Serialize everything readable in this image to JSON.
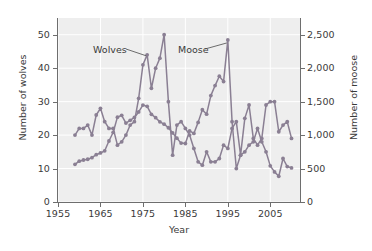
{
  "chart_data": {
    "type": "line",
    "title": "",
    "xlabel": "Year",
    "ylabel": "Number of wolves",
    "ylabel_right": "Number of moose",
    "xlim": [
      1955,
      2012
    ],
    "ylim": [
      0,
      55
    ],
    "ylim_right": [
      0,
      2750
    ],
    "grid": true,
    "legend_position": "inline-annotations",
    "xticks": [
      "1955",
      "1965",
      "1975",
      "1985",
      "1995",
      "2005"
    ],
    "xtick_values": [
      1955,
      1965,
      1975,
      1985,
      1995,
      2005
    ],
    "yticks_left": [
      "0",
      "10",
      "20",
      "30",
      "40",
      "50"
    ],
    "ytick_values_left": [
      0,
      10,
      20,
      30,
      40,
      50
    ],
    "yticks_right": [
      "0",
      "500",
      "1,000",
      "1,500",
      "2,000",
      "2,500"
    ],
    "ytick_values_right": [
      0,
      500,
      1000,
      1500,
      2000,
      2500
    ],
    "line_color": "#8a7f93",
    "marker_color": "#8a7f93",
    "plot_background": "#eeeeee",
    "annotations": [
      {
        "text": "Wolves",
        "points_to_series": "Wolves"
      },
      {
        "text": "Moose",
        "points_to_series": "Moose"
      }
    ],
    "series": [
      {
        "name": "Wolves",
        "axis": "left",
        "x": [
          1959,
          1960,
          1961,
          1962,
          1963,
          1964,
          1965,
          1966,
          1967,
          1968,
          1969,
          1970,
          1971,
          1972,
          1973,
          1974,
          1975,
          1976,
          1977,
          1978,
          1979,
          1980,
          1981,
          1982,
          1983,
          1984,
          1985,
          1986,
          1987,
          1988,
          1989,
          1990,
          1991,
          1992,
          1993,
          1994,
          1995,
          1996,
          1997,
          1998,
          1999,
          2000,
          2001,
          2002,
          2003,
          2004,
          2005,
          2006,
          2007,
          2008,
          2009,
          2010
        ],
        "values": [
          20,
          22,
          22,
          23,
          20,
          26,
          28,
          24,
          22,
          22,
          17,
          18,
          20,
          23,
          24,
          31,
          41,
          44,
          34,
          40,
          43,
          50,
          30,
          14,
          23,
          24,
          22,
          20,
          16,
          12,
          11,
          15,
          12,
          12,
          13,
          17,
          16,
          22,
          24,
          14,
          25,
          29,
          19,
          17,
          19,
          29,
          30,
          30,
          21,
          23,
          24,
          19
        ],
        "marker": "circle"
      },
      {
        "name": "Moose",
        "axis": "right",
        "x": [
          1959,
          1960,
          1961,
          1962,
          1963,
          1964,
          1965,
          1966,
          1967,
          1968,
          1969,
          1970,
          1971,
          1972,
          1973,
          1974,
          1975,
          1976,
          1977,
          1978,
          1979,
          1980,
          1981,
          1982,
          1983,
          1984,
          1985,
          1986,
          1987,
          1988,
          1989,
          1990,
          1991,
          1992,
          1993,
          1994,
          1995,
          1996,
          1997,
          1998,
          1999,
          2000,
          2001,
          2002,
          2003,
          2004,
          2005,
          2006,
          2007,
          2008,
          2009,
          2010
        ],
        "values": [
          563,
          610,
          628,
          639,
          663,
          707,
          733,
          765,
          912,
          1042,
          1268,
          1295,
          1180,
          1220,
          1264,
          1346,
          1448,
          1430,
          1310,
          1260,
          1198,
          1163,
          1110,
          1033,
          954,
          880,
          874,
          1062,
          1025,
          1190,
          1380,
          1313,
          1590,
          1740,
          1880,
          1800,
          2422,
          1200,
          500,
          700,
          750,
          850,
          900,
          1100,
          900,
          750,
          540,
          450,
          385,
          650,
          530,
          510
        ],
        "marker": "circle"
      }
    ]
  },
  "axes": {
    "left": {
      "title": "Number of wolves",
      "tick_labels": [
        "0",
        "10",
        "20",
        "30",
        "40",
        "50"
      ]
    },
    "right": {
      "title": "Number of moose",
      "tick_labels": [
        "0",
        "500",
        "1,000",
        "1,500",
        "2,000",
        "2,500"
      ]
    },
    "bottom": {
      "title": "Year",
      "tick_labels": [
        "1955",
        "1965",
        "1975",
        "1985",
        "1995",
        "2005"
      ]
    }
  },
  "labels": {
    "wolves": "Wolves",
    "moose": "Moose"
  }
}
